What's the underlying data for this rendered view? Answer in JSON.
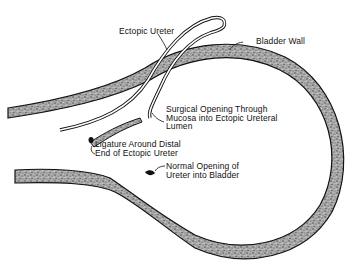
{
  "diagram": {
    "type": "anatomical-illustration",
    "colors": {
      "background": "#ffffff",
      "outline": "#111111",
      "wall_fill": "#9a9a9a",
      "wall_speckle": "#555555"
    },
    "labels": {
      "ectopic_ureter": "Ectopic Ureter",
      "bladder_wall": "Bladder Wall",
      "surgical_opening": {
        "line1": "Surgical Opening Through",
        "line2": "Mucosa into Ectopic Ureteral",
        "line3": "Lumen"
      },
      "ligature": {
        "line1": "Ligature Around Distal",
        "line2": "End of Ectopic Ureter"
      },
      "normal_opening": {
        "line1": "Normal Opening of",
        "line2": "Ureter into Bladder"
      }
    }
  }
}
